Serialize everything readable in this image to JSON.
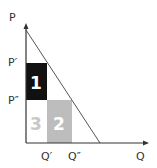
{
  "diagram": {
    "axes": {
      "y_label": "P",
      "x_label": "Q",
      "y_ticks": [
        "P′",
        "P″"
      ],
      "x_ticks": [
        "Q′",
        "Q″"
      ]
    },
    "regions": [
      {
        "id": "1",
        "label": "1",
        "color": "#111111"
      },
      {
        "id": "2",
        "label": "2",
        "color": "#bdbdbd"
      },
      {
        "id": "3",
        "label": "3",
        "color": "#ffffff",
        "text_color": "#c8c8c8"
      }
    ],
    "line_color": "#555555",
    "axis_color": "#333333"
  }
}
